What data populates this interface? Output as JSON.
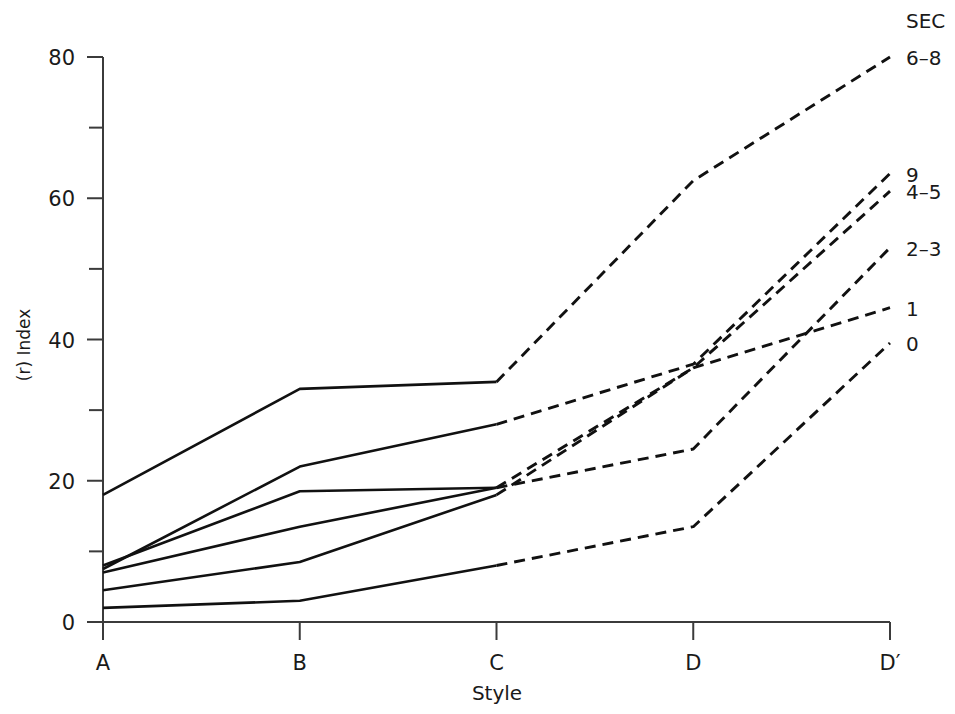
{
  "chart_data": {
    "type": "line",
    "title": "",
    "xlabel": "Style",
    "ylabel": "(r) Index",
    "categories": [
      "A",
      "B",
      "C",
      "D",
      "D′"
    ],
    "xtick_labels": [
      "A",
      "B",
      "C",
      "D",
      "D′"
    ],
    "ytick_labels": [
      "0",
      "20",
      "40",
      "60",
      "80"
    ],
    "ytick_values": [
      0,
      20,
      40,
      60,
      80
    ],
    "yminor_values": [
      10,
      30,
      50,
      70
    ],
    "ylim": [
      0,
      80
    ],
    "grid": false,
    "legend_title": "SEC",
    "legend_position": "right-of-line-ends",
    "line_style_note": "solid A–C, dashed C–D′",
    "series": [
      {
        "name": "6–8",
        "label": "6–8",
        "values": [
          18.0,
          33.0,
          34.0,
          62.5,
          80.0
        ]
      },
      {
        "name": "9",
        "label": "9",
        "values": [
          7.5,
          22.0,
          28.0,
          36.5,
          63.5
        ]
      },
      {
        "name": "4–5",
        "label": "4–5",
        "values": [
          8.0,
          18.5,
          19.0,
          36.0,
          61.0
        ]
      },
      {
        "name": "2–3",
        "label": "2–3",
        "values": [
          7.0,
          13.5,
          19.0,
          24.5,
          53.0
        ]
      },
      {
        "name": "1",
        "label": "1",
        "values": [
          4.5,
          8.5,
          18.0,
          36.0,
          44.5
        ]
      },
      {
        "name": "0",
        "label": "0",
        "values": [
          2.0,
          3.0,
          8.0,
          13.5,
          39.5
        ]
      }
    ]
  },
  "axes": {
    "x_title": "Style",
    "y_title": "(r) Index"
  },
  "legend": {
    "title": "SEC",
    "entries": [
      "6–8",
      "9",
      "4–5",
      "2–3",
      "1",
      "0"
    ]
  }
}
